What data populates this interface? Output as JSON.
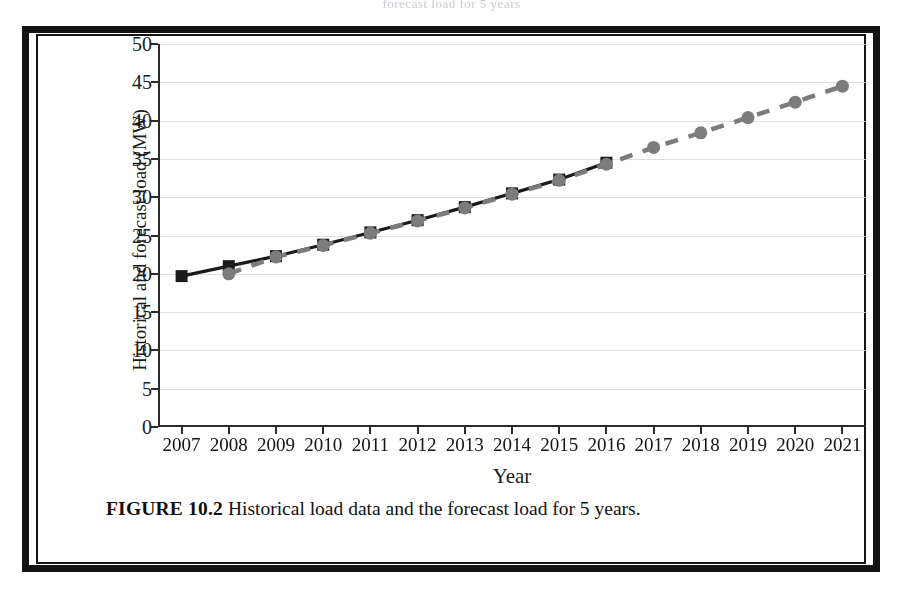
{
  "page": {
    "bleed_text": "forecast load for 5 years",
    "caption_label": "FIGURE 10.2",
    "caption_text": "Historical load data and the forecast load for 5 years."
  },
  "colors": {
    "historical": "#1a1a1a",
    "forecast": "#7c7c7c",
    "grid": "#d9d9d9",
    "axis": "#2b2b2b",
    "frame": "#131313"
  },
  "chart_data": {
    "type": "line",
    "title": "",
    "xlabel": "Year",
    "ylabel": "Historical and forecast load (MW)",
    "ylim": [
      0,
      50
    ],
    "ytick_step": 5,
    "yticks": [
      "0",
      "5",
      "10",
      "15",
      "20",
      "25",
      "30",
      "35",
      "40",
      "45",
      "50"
    ],
    "grid": true,
    "legend": "none",
    "categories": [
      "2007",
      "2008",
      "2009",
      "2010",
      "2011",
      "2012",
      "2013",
      "2014",
      "2015",
      "2016",
      "2017",
      "2018",
      "2019",
      "2020",
      "2021"
    ],
    "series": [
      {
        "name": "Historical load",
        "style": "solid",
        "marker": "square",
        "color": "#1a1a1a",
        "x": [
          "2007",
          "2008",
          "2009",
          "2010",
          "2011",
          "2012",
          "2013",
          "2014",
          "2015",
          "2016"
        ],
        "values": [
          19.7,
          21.0,
          22.3,
          23.8,
          25.4,
          27.0,
          28.7,
          30.5,
          32.3,
          34.5
        ]
      },
      {
        "name": "Forecast load",
        "style": "dashed",
        "marker": "circle",
        "color": "#7c7c7c",
        "x": [
          "2008",
          "2009",
          "2010",
          "2011",
          "2012",
          "2013",
          "2014",
          "2015",
          "2016",
          "2017",
          "2018",
          "2019",
          "2020",
          "2021"
        ],
        "values": [
          20.0,
          22.2,
          23.7,
          25.3,
          26.9,
          28.6,
          30.4,
          32.2,
          34.3,
          36.5,
          38.4,
          40.4,
          42.4,
          44.5
        ]
      }
    ]
  }
}
